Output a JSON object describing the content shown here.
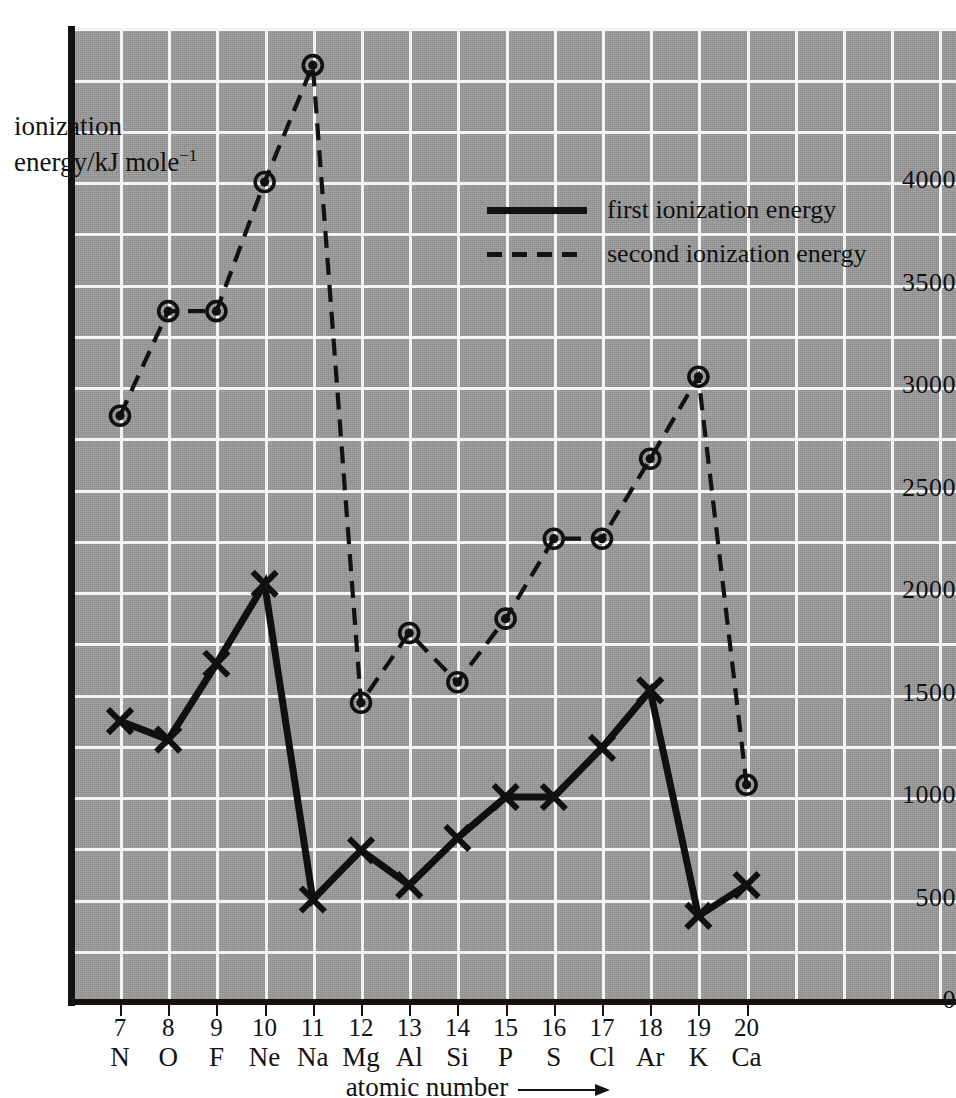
{
  "chart_data": {
    "type": "line",
    "title": "",
    "xlabel": "atomic number",
    "ylabel": "ionization energy/kJ mole⁻¹",
    "ylabel_lines": [
      "ionization",
      "energy/kJ mole"
    ],
    "ylabel_exponent": "−1",
    "xlim": [
      6.5,
      21.5
    ],
    "ylim": [
      0,
      4750
    ],
    "grid": true,
    "grid_y_step": 250,
    "legend_position": "upper-center-right",
    "categories": [
      7,
      8,
      9,
      10,
      11,
      12,
      13,
      14,
      15,
      16,
      17,
      18,
      19,
      20
    ],
    "category_symbols": [
      "N",
      "O",
      "F",
      "Ne",
      "Na",
      "Mg",
      "Al",
      "Si",
      "P",
      "S",
      "Cl",
      "Ar",
      "K",
      "Ca"
    ],
    "ytick_labels": [
      "0",
      "500",
      "1000",
      "1500",
      "2000",
      "2500",
      "3000",
      "3500",
      "4000"
    ],
    "ytick_values": [
      0,
      500,
      1000,
      1500,
      2000,
      2500,
      3000,
      3500,
      4000
    ],
    "series": [
      {
        "name": "first ionization energy",
        "style": "solid",
        "marker": "cross",
        "values": [
          1370,
          1280,
          1650,
          2040,
          500,
          740,
          570,
          800,
          1000,
          1000,
          1240,
          1520,
          420,
          570
        ]
      },
      {
        "name": "second ionization energy",
        "style": "dashed",
        "marker": "circle-dot",
        "values": [
          2860,
          3370,
          3370,
          4000,
          4570,
          1460,
          1800,
          1560,
          1870,
          2260,
          2260,
          2650,
          3050,
          1060
        ]
      }
    ]
  },
  "axis": {
    "x_title": "atomic number",
    "y_title_line1": "ionization",
    "y_title_line2": "energy/kJ mole",
    "y_title_sup": "−1"
  },
  "legend": {
    "items": [
      {
        "label": "first ionization energy",
        "key": "solid-line-key"
      },
      {
        "label": "second ionization energy",
        "key": "dashed-line-key"
      }
    ]
  }
}
